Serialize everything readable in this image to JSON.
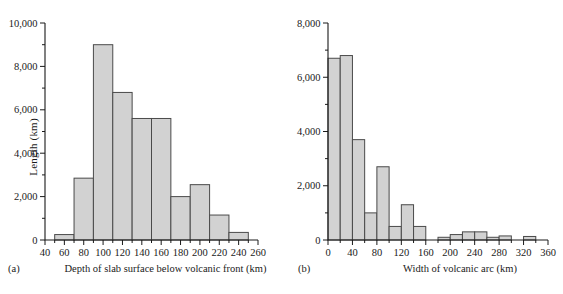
{
  "figure": {
    "panels": [
      {
        "letter": "(a)",
        "xlabel": "Depth of slab surface below volcanic front (km)",
        "ylabel": "Length (km)"
      },
      {
        "letter": "(b)",
        "xlabel": "Width of volcanic arc (km)",
        "ylabel": ""
      }
    ]
  },
  "chart_data": [
    {
      "type": "bar",
      "title": "Depth of slab surface below volcanic front",
      "xlabel": "Depth of slab surface below volcanic front (km)",
      "ylabel": "Length (km)",
      "panel": "(a)",
      "bin_width": 20,
      "bin_edges": [
        50,
        70,
        90,
        110,
        130,
        150,
        170,
        190,
        210,
        230,
        250
      ],
      "categories": [
        "50-70",
        "70-90",
        "90-110",
        "110-130",
        "130-150",
        "150-170",
        "170-190",
        "190-210",
        "210-230",
        "230-250"
      ],
      "values": [
        250,
        2850,
        9000,
        6800,
        5600,
        5600,
        2000,
        2550,
        1150,
        350
      ],
      "xlim": [
        40,
        260
      ],
      "ylim": [
        0,
        10000
      ],
      "xticks": [
        40,
        60,
        80,
        100,
        120,
        140,
        160,
        180,
        200,
        220,
        240,
        260
      ],
      "xtick_labels": [
        "40",
        "60",
        "80",
        "100",
        "120",
        "140",
        "160",
        "180",
        "200",
        "220",
        "240",
        "260"
      ],
      "yticks": [
        0,
        2000,
        4000,
        6000,
        8000,
        10000
      ],
      "ytick_labels": [
        "0",
        "2,000",
        "4,000",
        "6,000",
        "8,000",
        "10,000"
      ],
      "yminor_ticks": [
        1000,
        3000,
        5000,
        7000,
        9000
      ],
      "grid": false,
      "legend": "none"
    },
    {
      "type": "bar",
      "title": "Width of volcanic arc",
      "xlabel": "Width of volcanic arc (km)",
      "ylabel": "Length (km)",
      "panel": "(b)",
      "bin_width": 20,
      "bin_edges": [
        0,
        20,
        40,
        60,
        80,
        100,
        120,
        140,
        160,
        180,
        200,
        220,
        240,
        260,
        280,
        300,
        320,
        340,
        360
      ],
      "categories": [
        "0-20",
        "20-40",
        "40-60",
        "60-80",
        "80-100",
        "100-120",
        "120-140",
        "140-160",
        "160-180",
        "180-200",
        "200-220",
        "220-240",
        "240-260",
        "260-280",
        "280-300",
        "300-320",
        "320-340",
        "340-360"
      ],
      "values": [
        6700,
        6800,
        3700,
        1000,
        2700,
        500,
        1300,
        500,
        0,
        100,
        200,
        300,
        300,
        100,
        150,
        0,
        130,
        0
      ],
      "xlim": [
        0,
        360
      ],
      "ylim": [
        0,
        8000
      ],
      "xticks": [
        0,
        40,
        80,
        120,
        160,
        200,
        240,
        280,
        320,
        360
      ],
      "xtick_labels": [
        "0",
        "40",
        "80",
        "120",
        "160",
        "200",
        "240",
        "280",
        "320",
        "360"
      ],
      "yticks": [
        0,
        2000,
        4000,
        6000,
        8000
      ],
      "ytick_labels": [
        "0",
        "2,000",
        "4,000",
        "6,000",
        "8,000"
      ],
      "yminor_ticks": [
        1000,
        3000,
        5000,
        7000
      ],
      "grid": false,
      "legend": "none"
    }
  ]
}
